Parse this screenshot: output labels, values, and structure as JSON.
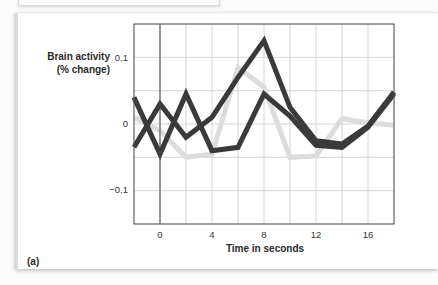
{
  "chart_data": {
    "type": "line",
    "title": "",
    "panel_label": "(a)",
    "xlabel": "Time in seconds",
    "ylabel_line1": "Brain activity",
    "ylabel_line2": "(% change)",
    "xlim": [
      -2,
      18
    ],
    "ylim": [
      -0.15,
      0.15
    ],
    "x_ticks": [
      "0",
      "4",
      "8",
      "12",
      "16"
    ],
    "y_ticks": [
      "0.1",
      "0",
      "−0.1"
    ],
    "grid": true,
    "legend": null,
    "x": [
      -2,
      0,
      2,
      4,
      6,
      8,
      10,
      12,
      14,
      16,
      18
    ],
    "series": [
      {
        "name": "dark series A",
        "color": "#3a3a3a",
        "values": [
          0.04,
          -0.045,
          0.045,
          -0.04,
          -0.035,
          0.045,
          0.012,
          -0.032,
          -0.035,
          -0.005,
          0.045
        ]
      },
      {
        "name": "dark series B",
        "color": "#3a3a3a",
        "values": [
          -0.035,
          0.03,
          -0.02,
          0.01,
          0.07,
          0.125,
          0.025,
          -0.025,
          -0.03,
          -0.003,
          0.048
        ]
      },
      {
        "name": "light series",
        "color": "#dcdcdc",
        "values": [
          0.01,
          -0.01,
          -0.05,
          -0.045,
          0.085,
          0.055,
          -0.05,
          -0.048,
          0.008,
          0.002,
          -0.002
        ]
      }
    ]
  }
}
